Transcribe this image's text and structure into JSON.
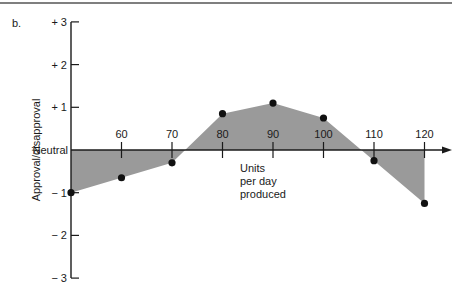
{
  "panel_label": "b.",
  "chart_data": {
    "type": "area",
    "title": "",
    "xlabel": "Units per day produced",
    "xlabel_lines": [
      "Units",
      "per day",
      "produced"
    ],
    "ylabel": "Approval/disapproval",
    "x_ticks": [
      60,
      70,
      80,
      90,
      100,
      110,
      120
    ],
    "y_ticks": [
      "+ 3",
      "+ 2",
      "+ 1",
      "Neutral",
      "− 1",
      "− 2",
      "− 3"
    ],
    "y_tick_values": [
      3,
      2,
      1,
      0,
      -1,
      -2,
      -3
    ],
    "ylim": [
      -3,
      3
    ],
    "xlim": [
      50,
      125
    ],
    "x": [
      50,
      60,
      70,
      80,
      90,
      100,
      110,
      120
    ],
    "values": [
      -1.0,
      -0.65,
      -0.3,
      0.85,
      1.1,
      0.75,
      -0.25,
      -1.25
    ],
    "fill_color": "#9a9a9a",
    "point_color": "#111111",
    "grid": false,
    "legend": null
  }
}
